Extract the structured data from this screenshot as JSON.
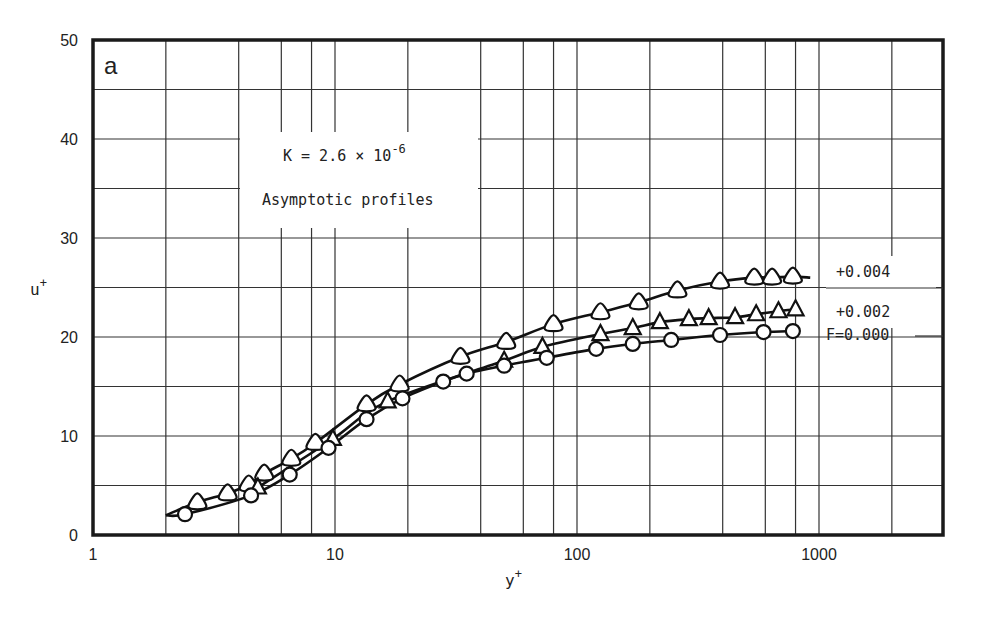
{
  "chart_data": {
    "type": "scatter",
    "panel_label": "a",
    "title": "",
    "xlabel": "y+",
    "ylabel": "u+",
    "xscale": "log",
    "xlim": [
      1,
      3000
    ],
    "ylim": [
      0,
      50
    ],
    "grid": true,
    "x_ticks": [
      "1",
      "10",
      "100",
      "1000"
    ],
    "y_ticks": [
      "0",
      "10",
      "20",
      "30",
      "40",
      "50"
    ],
    "annotations": [
      "K = 2.6 × 10^-6",
      "Asymptotic profiles"
    ],
    "legend_position": "inline-right",
    "series": [
      {
        "name": "+0.004",
        "marker": "rounded-triangle",
        "x": [
          2.7,
          3.6,
          4.4,
          5.1,
          6.6,
          8.3,
          13.5,
          18.5,
          33,
          51,
          80,
          125,
          180,
          260,
          390,
          540,
          640,
          780
        ],
        "y": [
          3.3,
          4.2,
          5.1,
          6.2,
          7.7,
          9.3,
          13.2,
          15.2,
          18.0,
          19.5,
          21.3,
          22.5,
          23.5,
          24.7,
          25.6,
          26.0,
          26.0,
          26.1
        ],
        "curve_end_x": 920,
        "curve_end_y": 26.0
      },
      {
        "name": "+0.002",
        "marker": "triangle",
        "x": [
          4.8,
          9.8,
          16.5,
          50,
          72,
          125,
          170,
          220,
          290,
          350,
          450,
          550,
          680,
          800
        ],
        "y": [
          4.8,
          9.7,
          13.5,
          17.6,
          19.0,
          20.3,
          20.9,
          21.5,
          21.8,
          21.9,
          22.0,
          22.3,
          22.6,
          22.8
        ],
        "curve_end_x": 820,
        "curve_end_y": 22.8
      },
      {
        "name": "F=0.000",
        "marker": "circle",
        "x": [
          2.4,
          4.5,
          6.5,
          9.4,
          13.5,
          19,
          28,
          35,
          50,
          75,
          120,
          170,
          245,
          390,
          590,
          780
        ],
        "y": [
          2.1,
          4.0,
          6.1,
          8.8,
          11.7,
          13.8,
          15.5,
          16.3,
          17.1,
          17.9,
          18.8,
          19.3,
          19.7,
          20.2,
          20.5,
          20.6
        ],
        "curve_start_x": 2.0,
        "curve_start_y": 2.0
      }
    ]
  }
}
